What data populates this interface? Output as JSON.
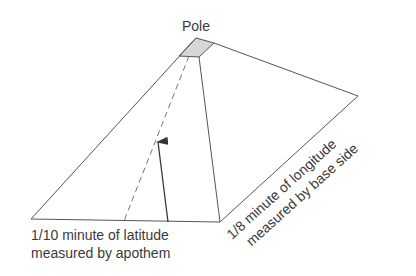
{
  "diagram": {
    "title_label": "Pole",
    "bottom_label_line1": "1/10 minute of latitude",
    "bottom_label_line2": "measured by apothem",
    "side_label_line1": "1/8 minute of longitude",
    "side_label_line2": "measured by base side",
    "colors": {
      "line": "#555555",
      "cap_fill": "#d6d6d6",
      "text": "#3a3a3a"
    }
  }
}
